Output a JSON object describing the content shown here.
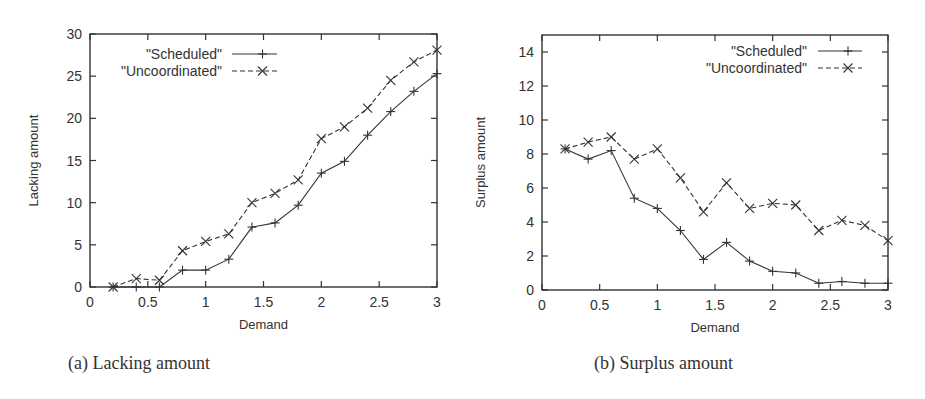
{
  "chart_data": [
    {
      "type": "line",
      "title": "",
      "caption": "(a) Lacking amount",
      "xlabel": "Demand",
      "ylabel": "Lacking amount",
      "xlim": [
        0,
        3
      ],
      "ylim": [
        0,
        30
      ],
      "xticks": [
        "0",
        "0.5",
        "1",
        "1.5",
        "2",
        "2.5",
        "3"
      ],
      "yticks": [
        "0",
        "5",
        "10",
        "15",
        "20",
        "25",
        "30"
      ],
      "grid": false,
      "legend_position": "upper left",
      "x": [
        0.2,
        0.4,
        0.6,
        0.8,
        1.0,
        1.2,
        1.4,
        1.6,
        1.8,
        2.0,
        2.2,
        2.4,
        2.6,
        2.8,
        3.0
      ],
      "series": [
        {
          "name": "\"Scheduled\"",
          "style": "solid",
          "marker": "+",
          "values": [
            0,
            0,
            0,
            2.0,
            2.0,
            3.3,
            7.1,
            7.6,
            9.7,
            13.5,
            14.9,
            18.0,
            20.8,
            23.2,
            25.3
          ]
        },
        {
          "name": "\"Uncoordinated\"",
          "style": "dashed",
          "marker": "x",
          "values": [
            0,
            1.0,
            0.8,
            4.3,
            5.4,
            6.3,
            10.0,
            11.1,
            12.7,
            17.6,
            19.0,
            21.2,
            24.5,
            26.7,
            28.1
          ]
        }
      ]
    },
    {
      "type": "line",
      "title": "",
      "caption": "(b) Surplus amount",
      "xlabel": "Demand",
      "ylabel": "Surplus amount",
      "xlim": [
        0,
        3
      ],
      "ylim": [
        0,
        15
      ],
      "xticks": [
        "0",
        "0.5",
        "1",
        "1.5",
        "2",
        "2.5",
        "3"
      ],
      "yticks": [
        "0",
        "2",
        "4",
        "6",
        "8",
        "10",
        "12",
        "14"
      ],
      "grid": false,
      "legend_position": "upper right",
      "x": [
        0.2,
        0.4,
        0.6,
        0.8,
        1.0,
        1.2,
        1.4,
        1.6,
        1.8,
        2.0,
        2.2,
        2.4,
        2.6,
        2.8,
        3.0
      ],
      "series": [
        {
          "name": "\"Scheduled\"",
          "style": "solid",
          "marker": "+",
          "values": [
            8.3,
            7.7,
            8.2,
            5.4,
            4.8,
            3.5,
            1.8,
            2.8,
            1.7,
            1.1,
            1.0,
            0.4,
            0.5,
            0.4,
            0.4
          ]
        },
        {
          "name": "\"Uncoordinated\"",
          "style": "dashed",
          "marker": "x",
          "values": [
            8.3,
            8.7,
            9.0,
            7.7,
            8.3,
            6.6,
            4.6,
            6.3,
            4.8,
            5.1,
            5.0,
            3.5,
            4.1,
            3.8,
            2.9
          ]
        }
      ]
    }
  ]
}
